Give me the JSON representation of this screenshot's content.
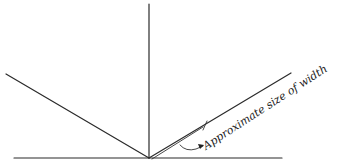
{
  "diagram": {
    "annotation": {
      "label": "Approximate size of width"
    },
    "colors": {
      "line": "#2a2a2a",
      "background": "#ffffff"
    }
  }
}
